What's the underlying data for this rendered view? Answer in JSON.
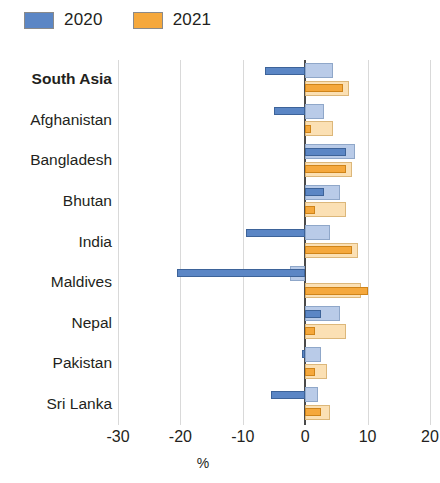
{
  "legend": {
    "items": [
      {
        "label": "2020",
        "color": "#5b86c5",
        "light": "#b9cbe8"
      },
      {
        "label": "2021",
        "color": "#f5a83c",
        "light": "#fbe0b4"
      }
    ]
  },
  "axis": {
    "title": "%",
    "ticks": [
      "-30",
      "-20",
      "-10",
      "0",
      "10",
      "20"
    ]
  },
  "chart_data": {
    "type": "bar",
    "orientation": "horizontal",
    "title": "",
    "xlabel": "%",
    "ylabel": "",
    "xlim": [
      -30,
      20
    ],
    "xticks": [
      -30,
      -20,
      -10,
      0,
      10,
      20
    ],
    "grid": true,
    "legend_position": "top-left",
    "categories": [
      "South Asia",
      "Afghanistan",
      "Bangladesh",
      "Bhutan",
      "India",
      "Maldives",
      "Nepal",
      "Pakistan",
      "Sri Lanka"
    ],
    "emphasized_category": "South Asia",
    "series": [
      {
        "name": "2020",
        "variant": "light",
        "color": "#b9cbe8",
        "values": [
          4.5,
          3.0,
          8.0,
          5.5,
          4.0,
          -2.5,
          5.5,
          2.5,
          2.0
        ]
      },
      {
        "name": "2020",
        "variant": "dark",
        "color": "#5b86c5",
        "values": [
          -6.5,
          -5.0,
          6.5,
          3.0,
          -9.5,
          -20.5,
          2.5,
          -0.5,
          -5.5
        ]
      },
      {
        "name": "2021",
        "variant": "light",
        "color": "#fbe0b4",
        "values": [
          7.0,
          4.5,
          7.5,
          6.5,
          8.5,
          9.0,
          6.5,
          3.5,
          4.0
        ]
      },
      {
        "name": "2021",
        "variant": "dark",
        "color": "#f5a83c",
        "values": [
          6.0,
          1.0,
          6.5,
          1.5,
          7.5,
          10.0,
          1.5,
          1.5,
          2.5
        ]
      }
    ]
  }
}
